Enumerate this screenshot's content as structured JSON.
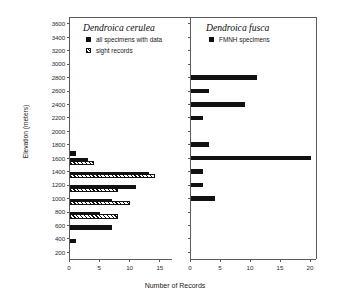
{
  "figure": {
    "ylabel": "Elevation (meters)",
    "xlabel": "Number of Records"
  },
  "left_panel": {
    "title": "Dendroica cerulea",
    "legend": [
      {
        "key": "all-specimens",
        "label": "all specimens with data",
        "style": "solid"
      },
      {
        "key": "sight-records",
        "label": "sight records",
        "style": "hatch"
      }
    ]
  },
  "right_panel": {
    "title": "Dendroica fusca",
    "legend": [
      {
        "key": "fmnh-specimens",
        "label": "FMNH specimens",
        "style": "solid"
      }
    ]
  },
  "axes": {
    "y_ticks": [
      "3600",
      "3400",
      "3200",
      "3000",
      "2800",
      "2600",
      "2400",
      "2200",
      "2000",
      "1800",
      "1600",
      "1400",
      "1200",
      "1000",
      "800",
      "600",
      "400",
      "200"
    ],
    "y_min": 100,
    "y_max": 3700,
    "x_ticks_left": [
      "0",
      "5",
      "10",
      "15"
    ],
    "x_ticks_right": [
      "0",
      "5",
      "10",
      "15",
      "20"
    ],
    "x_left_max": 17,
    "x_right_max": 21
  },
  "chart_data": {
    "type": "bar",
    "xlabel": "Number of Records",
    "ylabel": "Elevation (meters)",
    "orientation": "horizontal",
    "grid": false,
    "legend_position": "top-left of each panel",
    "panels": [
      {
        "name": "Dendroica cerulea",
        "xlim": [
          0,
          17
        ],
        "ylim": [
          100,
          3700
        ],
        "xticks": [
          0,
          5,
          10,
          15
        ],
        "yticks": [
          200,
          400,
          600,
          800,
          1000,
          1200,
          1400,
          1600,
          1800,
          2000,
          2200,
          2400,
          2600,
          2800,
          3000,
          3200,
          3400,
          3600
        ],
        "categories": [
          400,
          600,
          700,
          800,
          900,
          1000,
          1100,
          1200,
          1300,
          1400,
          1500,
          1600,
          1700
        ],
        "series": [
          {
            "name": "all specimens with data",
            "style": "solid",
            "values": [
              1,
              7,
              0,
              5,
              0,
              7,
              0,
              11,
              0,
              13,
              0,
              3,
              1
            ]
          },
          {
            "name": "sight records",
            "style": "hatch",
            "values": [
              0,
              0,
              8,
              0,
              10,
              0,
              8,
              0,
              14,
              0,
              4,
              0,
              0
            ]
          }
        ]
      },
      {
        "name": "Dendroica fusca",
        "xlim": [
          0,
          21
        ],
        "ylim": [
          100,
          3700
        ],
        "xticks": [
          0,
          5,
          10,
          15,
          20
        ],
        "yticks": [
          200,
          400,
          600,
          800,
          1000,
          1200,
          1400,
          1600,
          1800,
          2000,
          2200,
          2400,
          2600,
          2800,
          3000,
          3200,
          3400,
          3600
        ],
        "categories": [
          1000,
          1200,
          1400,
          1600,
          1800,
          2200,
          2400,
          2600,
          2800
        ],
        "series": [
          {
            "name": "FMNH specimens",
            "style": "solid",
            "values": [
              4,
              2,
              2,
              20,
              3,
              2,
              9,
              3,
              11
            ]
          }
        ]
      }
    ]
  }
}
